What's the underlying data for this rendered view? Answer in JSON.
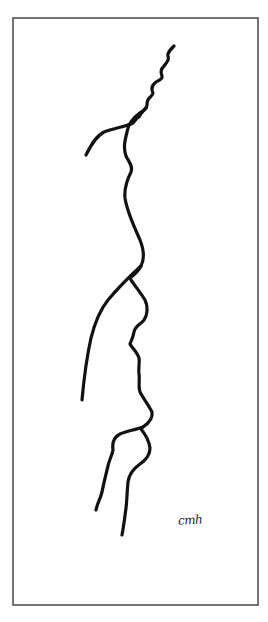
{
  "artwork": {
    "type": "continuous line drawing",
    "subject": "two facial profiles",
    "signature": "cmh",
    "colors": {
      "background": "#ffffff",
      "line": "#111111",
      "frame": "#3a3a3a"
    },
    "frame": {
      "x": 13,
      "y": 18,
      "width": 245,
      "height": 587
    },
    "paths": [
      {
        "name": "wavy-top-line",
        "d": "M174,46 C170,50 167,53 168,56 C170,60 166,63 164,66 C161,69 160,72 162,76 C163,79 158,81 156,82 C152,85 151,89 153,93 C153,96 149,97 148,100 C146,103 148,106 146,108 C144,110 141,112 139,117"
      },
      {
        "name": "hair-branch-line",
        "d": "M146,108 C141,113 137,118 133,123 C125,127 114,128 104,132 C96,136 91,145 86,155"
      },
      {
        "name": "forehead-nose-line",
        "d": "M141,112 C134,117 128,124 127,132 C125,140 123,148 126,156 C129,162 133,166 131,172 C127,180 124,188 125,198 C127,212 134,226 140,240 C144,250 145,258 141,266 C138,272 134,275 130,278"
      },
      {
        "name": "long-left-curve",
        "d": "M141,266 C130,276 118,288 108,300 C100,310 95,322 91,338 C87,356 84,378 82,400"
      },
      {
        "name": "lower-profile-line",
        "d": "M131,280 C135,286 140,292 145,300 C148,306 148,314 144,320 C140,325 135,326 134,332 C133,338 131,341 130,344 C132,348 137,352 139,358 C140,364 138,368 139,374 C140,380 138,386 140,392 C143,398 148,404 152,412 C153,418 149,423 143,427"
      },
      {
        "name": "lower-left-line",
        "d": "M143,427 C135,430 127,431 120,434 C114,437 112,443 113,450 C112,456 109,460 108,466 C106,474 104,482 102,492 C100,500 97,504 96,510"
      },
      {
        "name": "lower-right-line",
        "d": "M141,429 C145,434 149,440 150,448 C150,455 146,460 140,464 C133,469 129,474 128,482 C127,492 127,500 126,508 C125,516 124,524 122,535"
      }
    ]
  }
}
